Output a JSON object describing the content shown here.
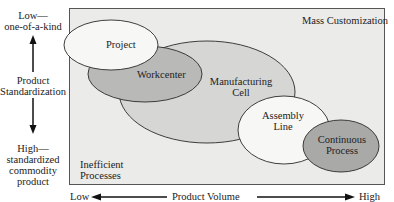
{
  "diagram": {
    "y_axis": {
      "top_label_1": "Low—",
      "top_label_2": "one-of-a-kind",
      "middle_label_1": "Product",
      "middle_label_2": "Standardization",
      "bottom_label_1": "High—",
      "bottom_label_2": "standardized",
      "bottom_label_3": "commodity",
      "bottom_label_4": "product"
    },
    "x_axis": {
      "left_label": "Low",
      "center_label": "Product Volume",
      "right_label": "High"
    },
    "regions": {
      "top_right": "Mass Customization",
      "bottom_left_1": "Inefficient",
      "bottom_left_2": "Processes"
    },
    "ellipses": [
      {
        "label_1": "Project",
        "label_2": "",
        "fill": "#f7f7f5"
      },
      {
        "label_1": "Workcenter",
        "label_2": "",
        "fill": "#b9b9b7"
      },
      {
        "label_1": "Manufacturing",
        "label_2": "Cell",
        "fill": "#d6d6d4"
      },
      {
        "label_1": "Assembly",
        "label_2": "Line",
        "fill": "#f7f7f5"
      },
      {
        "label_1": "Continuous",
        "label_2": "Process",
        "fill": "#a9a9a7"
      }
    ],
    "colors": {
      "panel_bg": "#ebebe9",
      "stroke": "#2a2a2a"
    }
  }
}
